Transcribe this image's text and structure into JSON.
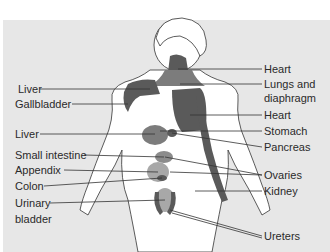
{
  "diagram": {
    "colors": {
      "background": "#ffffff",
      "panel": "#e7e7e7",
      "dark_region": "#5a5a5a",
      "medium_region": "#8c8c8c",
      "light_region": "#a8a8a8",
      "body_fill": "#ffffff",
      "outline": "#333333",
      "leader_line": "#333333"
    },
    "left_labels": [
      {
        "id": "liver-upper",
        "text": "Liver",
        "x": 18,
        "y": 83
      },
      {
        "id": "gallbladder",
        "text": "Gallbladder",
        "x": 15,
        "y": 98
      },
      {
        "id": "liver-lower",
        "text": "Liver",
        "x": 15,
        "y": 128
      },
      {
        "id": "small-intestine",
        "text": "Small intestine",
        "x": 15,
        "y": 149
      },
      {
        "id": "appendix",
        "text": "Appendix",
        "x": 15,
        "y": 164
      },
      {
        "id": "colon",
        "text": "Colon",
        "x": 15,
        "y": 180
      },
      {
        "id": "urinary-bladder-1",
        "text": "Urinary",
        "x": 15,
        "y": 197
      },
      {
        "id": "urinary-bladder-2",
        "text": "bladder",
        "x": 15,
        "y": 213
      }
    ],
    "right_labels": [
      {
        "id": "heart-upper",
        "text": "Heart",
        "x": 264,
        "y": 63
      },
      {
        "id": "lungs-1",
        "text": "Lungs and",
        "x": 264,
        "y": 78
      },
      {
        "id": "lungs-2",
        "text": "diaphragm",
        "x": 264,
        "y": 92
      },
      {
        "id": "heart-lower",
        "text": "Heart",
        "x": 264,
        "y": 109
      },
      {
        "id": "stomach",
        "text": "Stomach",
        "x": 264,
        "y": 125
      },
      {
        "id": "pancreas",
        "text": "Pancreas",
        "x": 264,
        "y": 141
      },
      {
        "id": "ovaries",
        "text": "Ovaries",
        "x": 264,
        "y": 169
      },
      {
        "id": "kidney",
        "text": "Kidney",
        "x": 264,
        "y": 185
      },
      {
        "id": "ureters",
        "text": "Ureters",
        "x": 264,
        "y": 230
      }
    ]
  }
}
